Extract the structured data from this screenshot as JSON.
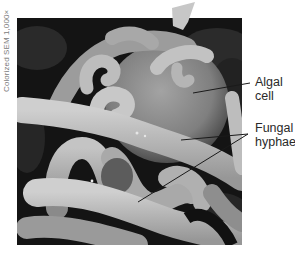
{
  "figure": {
    "type": "Colorized scanning electron micrograph of a lichen",
    "credit": "Colorized SEM 1,000×",
    "labels": [
      {
        "id": "algal-cell",
        "line1": "Algal",
        "line2": "cell"
      },
      {
        "id": "fungal-hyphae",
        "line1": "Fungal",
        "line2": "hyphae"
      }
    ]
  },
  "colors": {
    "background": "#ffffff",
    "photo_dark": "#1a1a1a",
    "hyphae": "#b8b8b8",
    "algal_cell": "#8a8a8a",
    "label_text": "#2a2a2a",
    "credit_text": "#7a7a7a",
    "leader_line": "#1a1a1a"
  }
}
